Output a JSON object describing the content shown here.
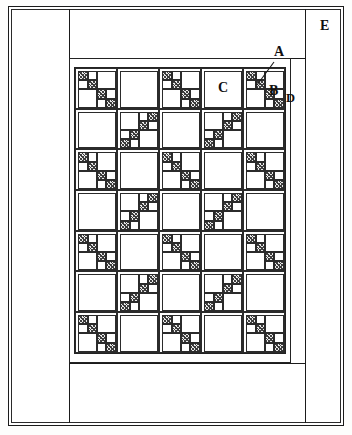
{
  "figure": {
    "kind": "patent-line-drawing",
    "background_color": "#ffffff",
    "line_color": "#1b1b1b"
  },
  "labels": [
    {
      "id": "A",
      "text": "A",
      "meaning": "pieced-unit-leader",
      "has_leader_line": true,
      "x": 277,
      "y": 55,
      "leader": {
        "x1": 274,
        "y1": 62,
        "x2": 257,
        "y2": 85
      }
    },
    {
      "id": "B",
      "text": "B",
      "meaning": "border-strip",
      "has_leader_line": false,
      "x": 272,
      "y": 91
    },
    {
      "id": "C",
      "text": "C",
      "meaning": "plain-block",
      "has_leader_line": false,
      "x": 221,
      "y": 88
    },
    {
      "id": "D",
      "text": "D",
      "meaning": "binding-edge",
      "has_leader_line": false,
      "x": 288,
      "y": 98
    },
    {
      "id": "E",
      "text": "E",
      "meaning": "backing-panel",
      "has_leader_line": false,
      "x": 323,
      "y": 27
    }
  ],
  "quilt": {
    "grid": {
      "columns": 5,
      "rows": 7,
      "cell_width": 42,
      "cell_height": 40.7
    },
    "sashing": {
      "outer_inset": 0,
      "inner_inset": 5
    },
    "block_orientations": [
      [
        "a",
        "b",
        "a",
        "b",
        "a"
      ],
      [
        "b",
        "a",
        "b",
        "a",
        "b"
      ],
      [
        "a",
        "b",
        "a",
        "b",
        "a"
      ],
      [
        "b",
        "a",
        "b",
        "a",
        "b"
      ],
      [
        "a",
        "b",
        "a",
        "b",
        "a"
      ],
      [
        "b",
        "a",
        "b",
        "a",
        "b"
      ],
      [
        "a",
        "b",
        "a",
        "b",
        "a"
      ]
    ],
    "block_a": {
      "name": "staircase-descending",
      "pieces": [
        {
          "name": "sq-1",
          "x": 2,
          "y": 2,
          "w": 9,
          "h": 9,
          "fill": "tex"
        },
        {
          "name": "sq-2",
          "x": 11,
          "y": 2,
          "w": 9,
          "h": 9,
          "fill": "plain"
        },
        {
          "name": "sq-3",
          "x": 2,
          "y": 11,
          "w": 9,
          "h": 9,
          "fill": "plain"
        },
        {
          "name": "sq-4",
          "x": 11,
          "y": 11,
          "w": 9,
          "h": 9,
          "fill": "tex"
        },
        {
          "name": "big-tr",
          "x": 20,
          "y": 2,
          "w": 18,
          "h": 18,
          "fill": "plain"
        },
        {
          "name": "sq-5",
          "x": 20,
          "y": 20,
          "w": 9,
          "h": 9,
          "fill": "tex"
        },
        {
          "name": "sq-6",
          "x": 29,
          "y": 20,
          "w": 9,
          "h": 9,
          "fill": "plain"
        },
        {
          "name": "sq-7",
          "x": 20,
          "y": 29,
          "w": 9,
          "h": 9,
          "fill": "plain"
        },
        {
          "name": "sq-8",
          "x": 29,
          "y": 29,
          "w": 9,
          "h": 9,
          "fill": "tex"
        },
        {
          "name": "big-bl",
          "x": 2,
          "y": 20,
          "w": 18,
          "h": 18,
          "fill": "plain"
        }
      ]
    },
    "block_b": {
      "name": "plain-with-corner-unit",
      "pieces": [
        {
          "name": "big-plain",
          "x": 2,
          "y": 2,
          "w": 36,
          "h": 36,
          "fill": "plain"
        }
      ]
    }
  },
  "frame": {
    "outer_border": true,
    "inner_border": true,
    "left_strip_x": 69,
    "right_strip_x": 291,
    "top_panel_bottom_y": 58,
    "bottom_panel_top_y": 363
  }
}
